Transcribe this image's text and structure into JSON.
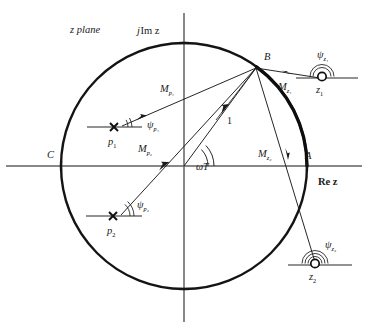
{
  "figure": {
    "plane_label": "z plane",
    "imag_axis_label_j": "j",
    "imag_axis_label_rest": "Im z",
    "real_axis_label": "Re z",
    "point_A": "A",
    "point_B": "B",
    "point_C": "C",
    "unit_vector_label": "1",
    "angle_omega_t": "ωT",
    "colors": {
      "stroke": "#1a1a1a",
      "axis": "#555555",
      "background": "#ffffff"
    }
  },
  "poles": [
    {
      "name": "p1",
      "label_base": "p",
      "label_sub": "1",
      "marker": "cross-marker",
      "x": 114,
      "y": 127,
      "magnitude_label_base": "M",
      "magnitude_label_sub": "p₁",
      "angle_label_base": "ψ",
      "angle_label_sub": "p₁"
    },
    {
      "name": "p2",
      "label_base": "p",
      "label_sub": "2",
      "marker": "cross-marker",
      "x": 113,
      "y": 216,
      "magnitude_label_base": "M",
      "magnitude_label_sub": "p₂",
      "angle_label_base": "ψ",
      "angle_label_sub": "p₂"
    }
  ],
  "zeros": [
    {
      "name": "z1",
      "label_base": "z",
      "label_sub": "1",
      "marker": "circle-marker",
      "x": 325,
      "y": 75,
      "magnitude_label_base": "M",
      "magnitude_label_sub": "z₁",
      "angle_label_base": "ψ",
      "angle_label_sub": "z₁"
    },
    {
      "name": "z2",
      "label_base": "z",
      "label_sub": "2",
      "marker": "circle-marker",
      "x": 318,
      "y": 265,
      "magnitude_label_base": "M",
      "magnitude_label_sub": "z₂",
      "angle_label_base": "ψ",
      "angle_label_sub": "z₂"
    }
  ],
  "unit_circle": {
    "center_x": 184,
    "center_y": 166,
    "radius": 123
  },
  "evaluation_point": {
    "label": "B",
    "x": 256,
    "y": 68
  }
}
